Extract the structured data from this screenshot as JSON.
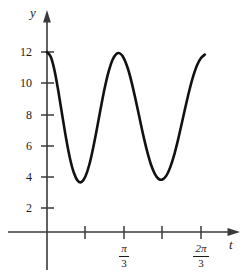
{
  "figure": {
    "title": "",
    "axes": {
      "y_axis_label": "y",
      "x_axis_label": "t"
    },
    "y_ticks": [
      {
        "label": "12",
        "value": 12
      },
      {
        "label": "10",
        "value": 10
      },
      {
        "label": "8",
        "value": 8
      },
      {
        "label": "6",
        "value": 6
      },
      {
        "label": "4",
        "value": 4
      },
      {
        "label": "2",
        "value": 2
      }
    ],
    "x_ticks": [
      {
        "label": "",
        "numerator": "",
        "denominator": "",
        "value": 0.5236
      },
      {
        "label": "π/3",
        "numerator": "π",
        "denominator": "3",
        "value": 1.0472
      },
      {
        "label": "",
        "numerator": "",
        "denominator": "",
        "value": 1.5708
      },
      {
        "label": "2π/3",
        "numerator": "2π",
        "denominator": "3",
        "value": 2.0944
      }
    ],
    "colors": {
      "curve": "#111111",
      "axis": "#3a3a3a",
      "background": "#ffffff"
    }
  },
  "chart_data": {
    "type": "line",
    "title": "",
    "xlabel": "t",
    "ylabel": "y",
    "xlim": [
      0,
      2.4435
    ],
    "ylim": [
      0,
      13.2
    ],
    "grid": false,
    "legend": null,
    "function": "y = 7.5 + 4.5*cos(6t)",
    "amplitude": 4.5,
    "midline": 7.5,
    "maximum": 12,
    "minimum": 3,
    "period": 1.0472,
    "series": [
      {
        "name": "y(t)",
        "x": [
          0.0,
          0.0524,
          0.1047,
          0.1571,
          0.2094,
          0.2618,
          0.3142,
          0.3665,
          0.4189,
          0.4712,
          0.5236,
          0.576,
          0.6283,
          0.6807,
          0.733,
          0.7854,
          0.8378,
          0.8901,
          0.9425,
          0.9948,
          1.0472,
          1.0996,
          1.1519,
          1.2043,
          1.2566,
          1.309,
          1.3614,
          1.4137,
          1.4661,
          1.5184,
          1.5708,
          1.6232,
          1.6755,
          1.7279,
          1.7802,
          1.8326,
          1.885,
          1.9373,
          1.9897,
          2.042,
          2.0944,
          2.1468
        ],
        "y": [
          12.0,
          11.66,
          10.71,
          9.3,
          7.72,
          6.18,
          4.87,
          3.93,
          3.41,
          3.34,
          3.72,
          4.5,
          5.62,
          6.93,
          8.31,
          9.61,
          10.69,
          11.46,
          11.87,
          11.9,
          11.56,
          10.9,
          9.96,
          8.84,
          7.65,
          6.46,
          5.39,
          4.5,
          3.88,
          3.54,
          3.5,
          3.76,
          4.31,
          5.11,
          6.11,
          7.23,
          8.38,
          9.47,
          10.41,
          11.13,
          11.6,
          11.83
        ]
      }
    ],
    "y_tick_values": [
      2,
      4,
      6,
      8,
      10,
      12
    ],
    "x_tick_values": [
      0.5236,
      1.0472,
      1.5708,
      2.0944
    ],
    "x_tick_labels": [
      "",
      "π/3",
      "",
      "2π/3"
    ]
  }
}
